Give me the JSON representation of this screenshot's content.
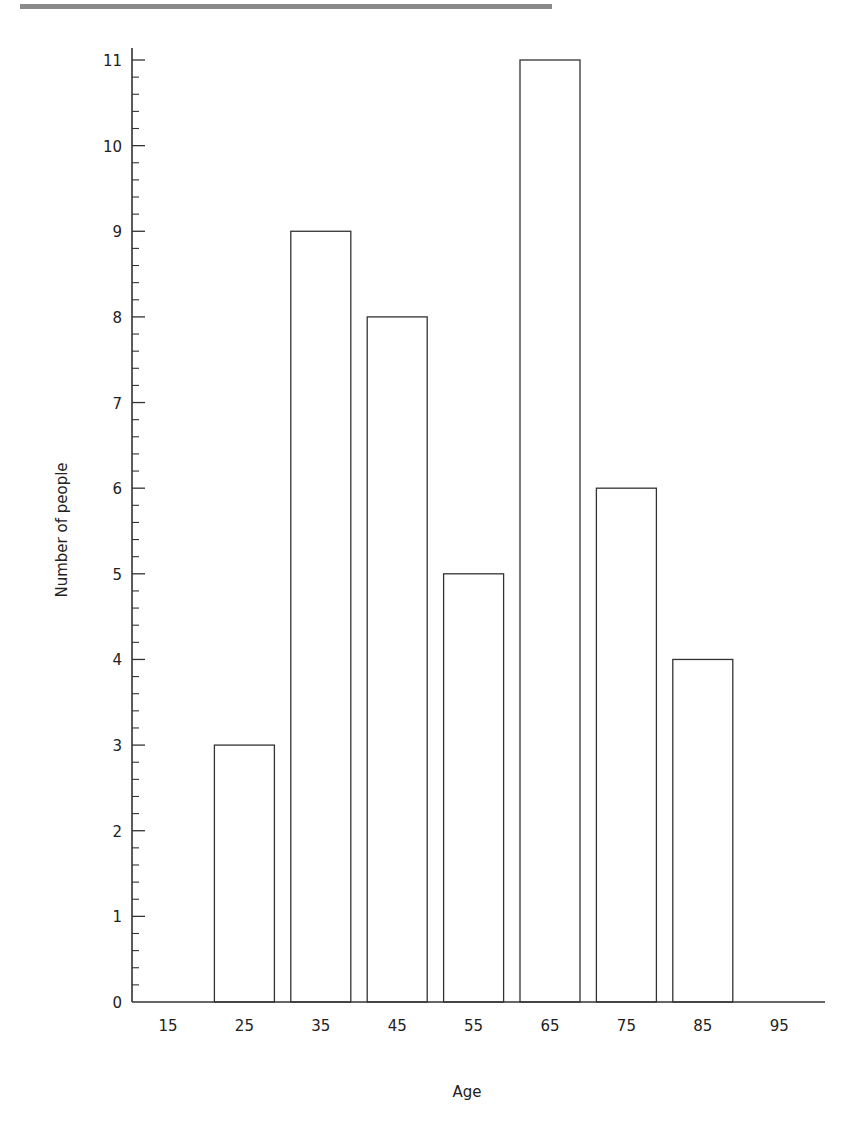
{
  "chart_data": {
    "type": "bar",
    "title": "",
    "xlabel": "Age",
    "ylabel": "Number of people",
    "categories": [
      "15",
      "25",
      "35",
      "45",
      "55",
      "65",
      "75",
      "85",
      "95"
    ],
    "values": [
      0,
      3,
      9,
      8,
      5,
      11,
      6,
      4,
      0
    ],
    "ylim": [
      0,
      11
    ],
    "yticks": [
      "0",
      "1",
      "2",
      "3",
      "4",
      "5",
      "6",
      "7",
      "8",
      "9",
      "10",
      "11"
    ],
    "minor_ticks_per_unit": 5,
    "grid": false,
    "legend": null,
    "bar_fill": "#ffffff",
    "bar_stroke": "#333333"
  }
}
